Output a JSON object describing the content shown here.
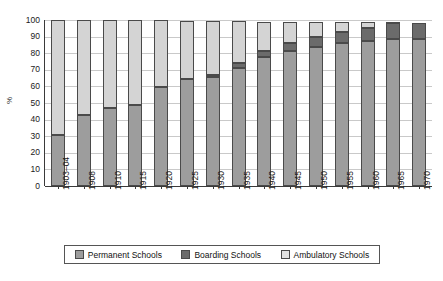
{
  "chart_data": {
    "type": "bar",
    "stacked": true,
    "title": "",
    "xlabel": "",
    "ylabel": "%",
    "ylim": [
      0,
      100
    ],
    "yticks": [
      0,
      10,
      20,
      30,
      40,
      50,
      60,
      70,
      80,
      90,
      100
    ],
    "grid": true,
    "legend_position": "bottom",
    "categories": [
      "1903–04",
      "1908",
      "1910",
      "1915",
      "1920",
      "1925",
      "1930",
      "1935",
      "1940",
      "1945",
      "1950",
      "1955",
      "1960",
      "1965",
      "1970"
    ],
    "series": [
      {
        "name": "Permanent Schools",
        "color": "#9d9d9d",
        "values": [
          31,
          43,
          47,
          49,
          59.5,
          64.5,
          65.5,
          71,
          77.5,
          81.5,
          83.5,
          86,
          87.5,
          88.5,
          88.5
        ]
      },
      {
        "name": "Boarding Schools",
        "color": "#6b6b6b",
        "values": [
          0,
          0,
          0,
          0,
          0,
          0,
          1.5,
          3,
          4,
          4.5,
          6,
          6.5,
          7.5,
          9.5,
          9.5
        ]
      },
      {
        "name": "Ambulatory Schools",
        "color": "#d4d4d4",
        "values": [
          69,
          57,
          53,
          51,
          40.5,
          35,
          32.5,
          25.5,
          17.5,
          13,
          9,
          6,
          3.5,
          0.5,
          0
        ]
      }
    ]
  },
  "legend": {
    "items": [
      {
        "label": "Permanent Schools",
        "swatch": "swatch-permanent"
      },
      {
        "label": "Boarding Schools",
        "swatch": "swatch-boarding"
      },
      {
        "label": "Ambulatory Schools",
        "swatch": "swatch-ambulatory"
      }
    ]
  },
  "axes": {
    "y_title": "%"
  }
}
